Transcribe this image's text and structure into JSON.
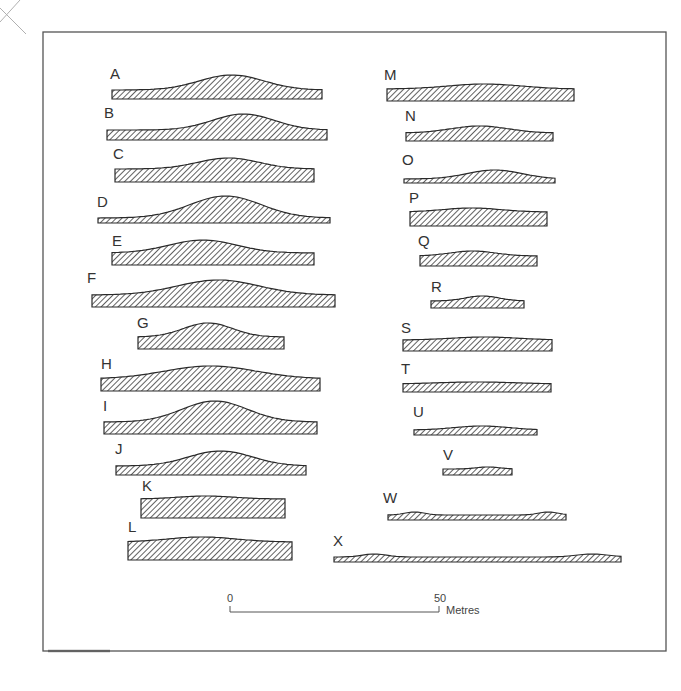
{
  "figure": {
    "type": "cross-section profiles",
    "profile_count": 24,
    "colors": {
      "outline": "#2a2a2a",
      "hatch": "#3a3a3a",
      "frame": "#555555",
      "background": "#ffffff"
    }
  },
  "scale_bar": {
    "start_label": "0",
    "end_label": "50",
    "unit": "Metres"
  },
  "profiles": [
    {
      "id": "A",
      "x0": 112,
      "x1": 322,
      "base": 97,
      "h": 24,
      "peak": 0.57,
      "width": 0.55,
      "side": 9
    },
    {
      "id": "B",
      "x0": 107,
      "x1": 327,
      "base": 138,
      "h": 26,
      "peak": 0.62,
      "width": 0.5,
      "side": 10
    },
    {
      "id": "C",
      "x0": 115,
      "x1": 314,
      "base": 180,
      "h": 24,
      "peak": 0.57,
      "width": 0.55,
      "side": 13
    },
    {
      "id": "D",
      "x0": 98,
      "x1": 330,
      "base": 221,
      "h": 27,
      "peak": 0.55,
      "width": 0.55,
      "side": 5
    },
    {
      "id": "E",
      "x0": 112,
      "x1": 314,
      "base": 263,
      "h": 25,
      "peak": 0.45,
      "width": 0.6,
      "side": 12
    },
    {
      "id": "F",
      "x0": 92,
      "x1": 335,
      "base": 305,
      "h": 27,
      "peak": 0.52,
      "width": 0.6,
      "side": 12
    },
    {
      "id": "G",
      "x0": 138,
      "x1": 284,
      "base": 347,
      "h": 26,
      "peak": 0.48,
      "width": 0.6,
      "side": 12
    },
    {
      "id": "H",
      "x0": 101,
      "x1": 320,
      "base": 389,
      "h": 25,
      "peak": 0.5,
      "width": 0.75,
      "side": 12
    },
    {
      "id": "I",
      "x0": 104,
      "x1": 317,
      "base": 432,
      "h": 33,
      "peak": 0.52,
      "width": 0.55,
      "side": 12
    },
    {
      "id": "J",
      "x0": 116,
      "x1": 306,
      "base": 473,
      "h": 24,
      "peak": 0.55,
      "width": 0.6,
      "side": 9
    },
    {
      "id": "K",
      "x0": 141,
      "x1": 285,
      "base": 516,
      "h": 22,
      "peak": 0.45,
      "width": 0.7,
      "side": 19
    },
    {
      "id": "L",
      "x0": 128,
      "x1": 292,
      "base": 558,
      "h": 23,
      "peak": 0.45,
      "width": 0.75,
      "side": 18
    },
    {
      "id": "M",
      "x0": 387,
      "x1": 574,
      "base": 99,
      "h": 17,
      "peak": 0.52,
      "width": 0.7,
      "side": 12
    },
    {
      "id": "N",
      "x0": 406,
      "x1": 553,
      "base": 139,
      "h": 15,
      "peak": 0.5,
      "width": 0.7,
      "side": 8
    },
    {
      "id": "O",
      "x0": 404,
      "x1": 555,
      "base": 181,
      "h": 13,
      "peak": 0.6,
      "width": 0.65,
      "side": 4
    },
    {
      "id": "P",
      "x0": 410,
      "x1": 547,
      "base": 224,
      "h": 18,
      "peak": 0.45,
      "width": 0.75,
      "side": 14
    },
    {
      "id": "Q",
      "x0": 420,
      "x1": 537,
      "base": 264,
      "h": 15,
      "peak": 0.45,
      "width": 0.7,
      "side": 10
    },
    {
      "id": "R",
      "x0": 431,
      "x1": 524,
      "base": 306,
      "h": 12,
      "peak": 0.55,
      "width": 0.65,
      "side": 7
    },
    {
      "id": "S",
      "x0": 403,
      "x1": 552,
      "base": 349,
      "h": 14,
      "peak": 0.55,
      "width": 0.8,
      "side": 11
    },
    {
      "id": "T",
      "x0": 403,
      "x1": 551,
      "base": 390,
      "h": 10,
      "peak": 0.5,
      "width": 0.95,
      "side": 8
    },
    {
      "id": "U",
      "x0": 414,
      "x1": 537,
      "base": 433,
      "h": 9,
      "peak": 0.55,
      "width": 0.8,
      "side": 5
    },
    {
      "id": "V",
      "x0": 443,
      "x1": 512,
      "base": 473,
      "h": 8,
      "peak": 0.65,
      "width": 0.6,
      "side": 6
    },
    {
      "id": "W",
      "x0": 388,
      "x1": 566,
      "base": 518,
      "h": 7,
      "peak": 0.15,
      "width": 0.2,
      "side": 4
    },
    {
      "id": "X",
      "x0": 334,
      "x1": 621,
      "base": 560,
      "h": 7,
      "peak": 0.14,
      "width": 0.15,
      "side": 4
    }
  ],
  "label_positions": {
    "A": [
      110,
      79
    ],
    "B": [
      104,
      118
    ],
    "C": [
      113,
      159
    ],
    "D": [
      97,
      207
    ],
    "E": [
      112,
      246
    ],
    "F": [
      87,
      283
    ],
    "G": [
      137,
      328
    ],
    "H": [
      101,
      369
    ],
    "I": [
      103,
      411
    ],
    "J": [
      115,
      454
    ],
    "K": [
      142,
      491
    ],
    "L": [
      128,
      532
    ],
    "M": [
      384,
      80
    ],
    "N": [
      405,
      121
    ],
    "O": [
      402,
      165
    ],
    "P": [
      409,
      203
    ],
    "Q": [
      418,
      246
    ],
    "R": [
      431,
      292
    ],
    "S": [
      401,
      333
    ],
    "T": [
      401,
      374
    ],
    "U": [
      413,
      417
    ],
    "V": [
      443,
      460
    ],
    "W": [
      383,
      503
    ],
    "X": [
      333,
      546
    ]
  }
}
